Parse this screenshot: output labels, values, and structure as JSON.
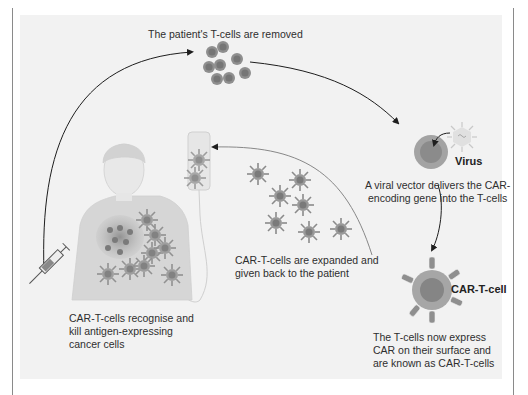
{
  "diagram": {
    "steps": [
      {
        "id": "remove",
        "text": "The patient's T-cells are removed"
      },
      {
        "id": "virus_label",
        "text": "Virus"
      },
      {
        "id": "transduce",
        "text_lines": [
          "A viral vector delivers the CAR-",
          "encoding gene into the T-cells"
        ]
      },
      {
        "id": "cart_label",
        "text": "CAR-T-cell"
      },
      {
        "id": "express",
        "text_lines": [
          "The T-cells now express",
          "CAR on their surface and",
          "are known as CAR-T-cells"
        ]
      },
      {
        "id": "expand",
        "text_lines": [
          "CAR-T-cells are expanded and",
          "given back to the patient"
        ]
      },
      {
        "id": "kill",
        "text_lines": [
          "CAR-T-cells recognise and",
          "kill antigen-expressing",
          "cancer cells"
        ]
      }
    ],
    "elements": [
      "patient-figure",
      "syringe-icon",
      "iv-bag-icon",
      "t-cell-cluster",
      "virus-icon",
      "t-cell-infected",
      "car-t-cell",
      "expanded-car-t-cells",
      "tumor-mass"
    ],
    "colors": {
      "background": "#f2f2f2",
      "cell_outer": "#8e8e8e",
      "cell_inner": "#6f6f6f",
      "arrow": "#1e1e1e",
      "patient": "#d9d9d9"
    }
  }
}
